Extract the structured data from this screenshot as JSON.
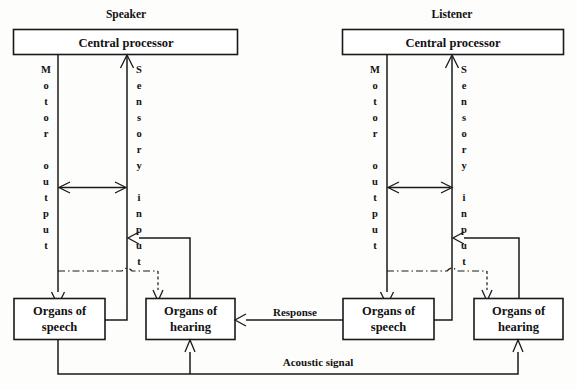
{
  "diagram": {
    "width": 577,
    "height": 390,
    "colors": {
      "background": "#fdfdfb",
      "stroke": "#1a1a1a",
      "box_fill": "#ffffff",
      "text": "#111111"
    }
  },
  "speaker": {
    "heading": "Speaker",
    "central_processor": "Central processor",
    "motor_output_label": "Motor output",
    "motor_output_letters": [
      "M",
      "o",
      "t",
      "o",
      "r",
      "",
      "o",
      "u",
      "t",
      "p",
      "u",
      "t"
    ],
    "sensory_input_label": "Sensory input",
    "sensory_input_letters": [
      "S",
      "e",
      "n",
      "s",
      "o",
      "r",
      "y",
      "",
      "i",
      "n",
      "p",
      "u",
      "t"
    ],
    "organs_of_speech_line1": "Organs of",
    "organs_of_speech_line2": "speech",
    "organs_of_hearing_line1": "Organs of",
    "organs_of_hearing_line2": "hearing"
  },
  "listener": {
    "heading": "Listener",
    "central_processor": "Central processor",
    "motor_output_label": "Motor output",
    "motor_output_letters": [
      "M",
      "o",
      "t",
      "o",
      "r",
      "",
      "o",
      "u",
      "t",
      "p",
      "u",
      "t"
    ],
    "sensory_input_label": "Sensory input",
    "sensory_input_letters": [
      "S",
      "e",
      "n",
      "s",
      "o",
      "r",
      "y",
      "",
      "i",
      "n",
      "p",
      "u",
      "t"
    ],
    "organs_of_speech_line1": "Organs of",
    "organs_of_speech_line2": "speech",
    "organs_of_hearing_line1": "Organs of",
    "organs_of_hearing_line2": "hearing"
  },
  "connections": {
    "response_label": "Response",
    "acoustic_signal_label": "Acoustic signal"
  }
}
